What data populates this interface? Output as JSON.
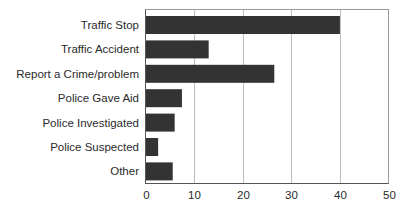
{
  "chart_data": {
    "type": "bar",
    "orientation": "horizontal",
    "title": "",
    "xlabel": "",
    "ylabel": "",
    "categories": [
      "Traffic Stop",
      "Traffic Accident",
      "Report a Crime/problem",
      "Police Gave Aid",
      "Police Investigated",
      "Police Suspected",
      "Other"
    ],
    "values": [
      40,
      13,
      26.5,
      7.5,
      6,
      2.6,
      5.6
    ],
    "xlim": [
      0,
      50
    ],
    "xticks": [
      0,
      10,
      20,
      30,
      40,
      50
    ],
    "xtick_labels": [
      "0",
      "10",
      "20",
      "30",
      "40",
      "50"
    ],
    "grid": "vertical",
    "legend": "none",
    "colors": {
      "bar": "#333333",
      "grid": "#bdbdbd",
      "frame": "#9a9a9a"
    }
  }
}
